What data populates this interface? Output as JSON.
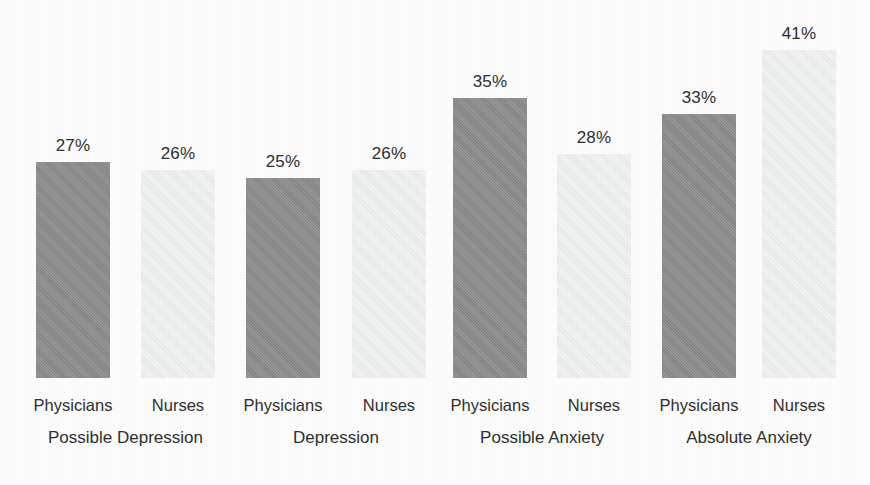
{
  "chart_data": {
    "type": "bar",
    "title": "",
    "subtitle": "",
    "xlabel": "",
    "ylabel": "",
    "ylim": [
      0,
      45
    ],
    "grid": false,
    "legend_position": "none",
    "value_suffix": "%",
    "categories": [
      "Possible Depression",
      "Depression",
      "Possible Anxiety",
      "Absolute Anxiety"
    ],
    "series": [
      {
        "name": "Physicians",
        "color": "#8d8d8d",
        "values": [
          27,
          25,
          35,
          33
        ]
      },
      {
        "name": "Nurses",
        "color": "#eeefef",
        "values": [
          26,
          26,
          28,
          41
        ]
      }
    ],
    "bars": [
      {
        "group": "Possible Depression",
        "series": "Physicians",
        "value": 27,
        "value_label": "27%",
        "series_label": "Physicians",
        "tone": "dark"
      },
      {
        "group": "Possible Depression",
        "series": "Nurses",
        "value": 26,
        "value_label": "26%",
        "series_label": "Nurses",
        "tone": "light"
      },
      {
        "group": "Depression",
        "series": "Physicians",
        "value": 25,
        "value_label": "25%",
        "series_label": "Physicians",
        "tone": "dark"
      },
      {
        "group": "Depression",
        "series": "Nurses",
        "value": 26,
        "value_label": "26%",
        "series_label": "Nurses",
        "tone": "light"
      },
      {
        "group": "Possible Anxiety",
        "series": "Physicians",
        "value": 35,
        "value_label": "35%",
        "series_label": "Physicians",
        "tone": "dark"
      },
      {
        "group": "Possible Anxiety",
        "series": "Nurses",
        "value": 28,
        "value_label": "28%",
        "series_label": "Nurses",
        "tone": "light"
      },
      {
        "group": "Absolute Anxiety",
        "series": "Physicians",
        "value": 33,
        "value_label": "33%",
        "series_label": "Physicians",
        "tone": "dark"
      },
      {
        "group": "Absolute Anxiety",
        "series": "Nurses",
        "value": 41,
        "value_label": "41%",
        "series_label": "Nurses",
        "tone": "light"
      }
    ],
    "group_labels": [
      {
        "label": "Possible Depression"
      },
      {
        "label": "Depression"
      },
      {
        "label": "Possible Anxiety"
      },
      {
        "label": "Absolute Anxiety"
      }
    ]
  },
  "colors": {
    "physicians_bar": "#8d8d8d",
    "nurses_bar": "#eeefef",
    "text": "#2f2f2f",
    "background": "#fdfdfd"
  }
}
